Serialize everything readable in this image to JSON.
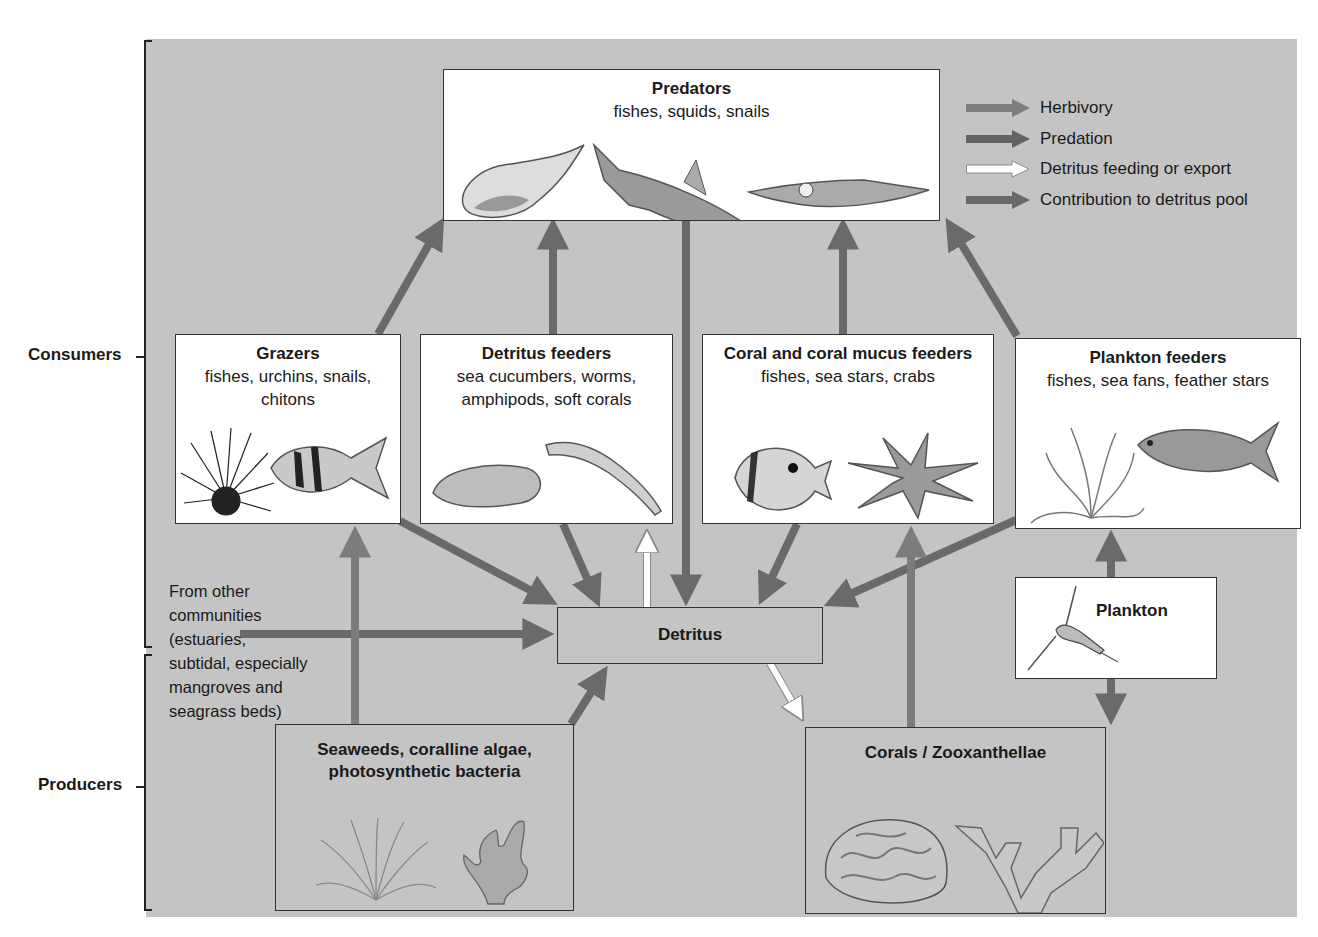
{
  "diagram": {
    "type": "coral reef food web",
    "levels": {
      "consumers_label": "Consumers",
      "producers_label": "Producers"
    },
    "legend": [
      {
        "label": "Herbivory",
        "color": "#7e7e7e"
      },
      {
        "label": "Predation",
        "color": "#666666"
      },
      {
        "label": "Detritus feeding or export",
        "color": "#ffffff"
      },
      {
        "label": "Contribution to detritus pool",
        "color": "#6e6e6e"
      }
    ],
    "nodes": {
      "predators": {
        "title": "Predators",
        "subtitle": "fishes, squids, snails",
        "icons": [
          "snail-shell",
          "shark",
          "squid"
        ]
      },
      "grazers": {
        "title": "Grazers",
        "subtitle_line1": "fishes, urchins, snails,",
        "subtitle_line2": "chitons",
        "icons": [
          "sea-urchin",
          "surgeonfish"
        ]
      },
      "detritus_feeders": {
        "title": "Detritus feeders",
        "subtitle_line1": "sea cucumbers, worms,",
        "subtitle_line2": "amphipods, soft corals",
        "icons": [
          "sea-cucumber",
          "worm"
        ]
      },
      "coral_feeders": {
        "title": "Coral and coral mucus feeders",
        "subtitle": "fishes, sea stars, crabs",
        "icons": [
          "butterflyfish",
          "crown-of-thorns-starfish"
        ]
      },
      "plankton_feeders": {
        "title": "Plankton feeders",
        "subtitle": "fishes, sea fans, feather stars",
        "icons": [
          "feather-star",
          "fish"
        ]
      },
      "plankton": {
        "title": "Plankton",
        "icons": [
          "copepod"
        ]
      },
      "detritus": {
        "title": "Detritus"
      },
      "seaweeds": {
        "title_line1": "Seaweeds, coralline algae,",
        "title_line2": "photosynthetic bacteria",
        "icons": [
          "seaweed-tuft",
          "coralline-algae"
        ]
      },
      "corals": {
        "title": "Corals / Zooxanthellae",
        "icons": [
          "brain-coral",
          "branching-coral"
        ]
      }
    },
    "external_source": {
      "lines": [
        "From other",
        "communities",
        "(estuaries,",
        "subtidal, especially",
        "mangroves and",
        "seagrass beds)"
      ]
    },
    "edges": [
      {
        "from": "grazers",
        "to": "predators",
        "type": "Predation"
      },
      {
        "from": "detritus_feeders",
        "to": "predators",
        "type": "Predation"
      },
      {
        "from": "coral_feeders",
        "to": "predators",
        "type": "Predation"
      },
      {
        "from": "plankton_feeders",
        "to": "predators",
        "type": "Predation"
      },
      {
        "from": "predators",
        "to": "detritus",
        "type": "Contribution to detritus pool"
      },
      {
        "from": "grazers",
        "to": "detritus",
        "type": "Contribution to detritus pool"
      },
      {
        "from": "detritus_feeders",
        "to": "detritus",
        "type": "Contribution to detritus pool"
      },
      {
        "from": "coral_feeders",
        "to": "detritus",
        "type": "Contribution to detritus pool"
      },
      {
        "from": "plankton_feeders",
        "to": "detritus",
        "type": "Contribution to detritus pool"
      },
      {
        "from": "detritus",
        "to": "detritus_feeders",
        "type": "Detritus feeding or export"
      },
      {
        "from": "detritus",
        "to": "corals",
        "type": "Detritus feeding or export"
      },
      {
        "from": "external_source",
        "to": "detritus",
        "type": "Contribution to detritus pool"
      },
      {
        "from": "seaweeds",
        "to": "grazers",
        "type": "Herbivory"
      },
      {
        "from": "seaweeds",
        "to": "detritus",
        "type": "Contribution to detritus pool"
      },
      {
        "from": "corals",
        "to": "coral_feeders",
        "type": "Herbivory"
      },
      {
        "from": "plankton",
        "to": "plankton_feeders",
        "type": "Predation"
      },
      {
        "from": "plankton",
        "to": "corals",
        "type": "Predation"
      }
    ]
  }
}
